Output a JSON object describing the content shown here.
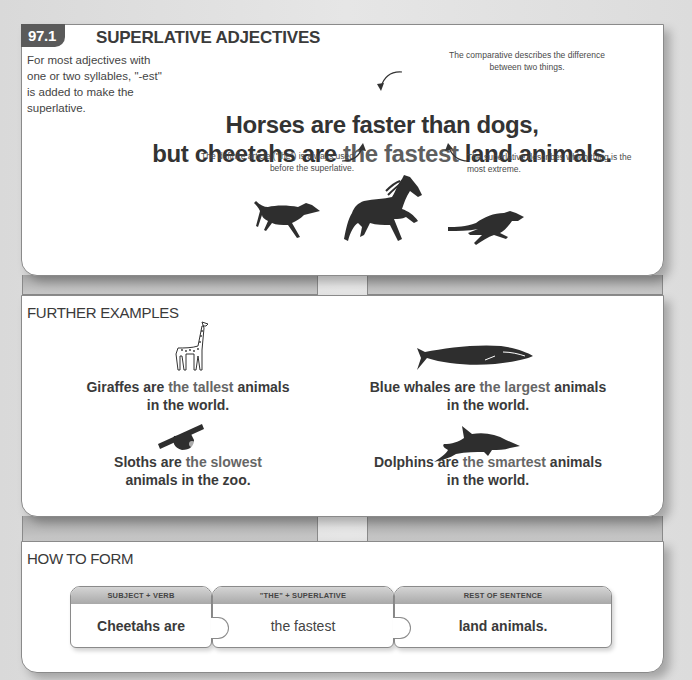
{
  "section": {
    "number": "97.1",
    "title": "SUPERLATIVE ADJECTIVES",
    "intro": "For most adjectives with one or two syllables, \"-est\" is added to make the superlative.",
    "headline": {
      "line1": "Horses are faster than dogs,",
      "line2_prefix": "but cheetahs are ",
      "line2_superlative": "the fastest",
      "line2_suffix": " land animals."
    },
    "notes": {
      "comparative": "The comparative describes the difference between two things.",
      "article": "The definite article (\"the\") is always used before the superlative.",
      "superlative": "The superlative describes which thing is the most extreme."
    },
    "animals": [
      "dog-icon",
      "horse-icon",
      "cheetah-icon"
    ]
  },
  "further_examples": {
    "title": "FURTHER EXAMPLES",
    "items": [
      {
        "icon": "giraffe-icon",
        "subject": "Giraffes are ",
        "superlative": "the tallest",
        "rest": " animals",
        "line2": "in the world."
      },
      {
        "icon": "blue-whale-icon",
        "subject": "Blue whales are ",
        "superlative": "the largest",
        "rest": " animals",
        "line2": "in the world."
      },
      {
        "icon": "sloth-icon",
        "subject": "Sloths are ",
        "superlative": "the slowest",
        "rest": "",
        "line2": "animals in the zoo."
      },
      {
        "icon": "dolphin-icon",
        "subject": "Dolphins are ",
        "superlative": "the smartest",
        "rest": " animals",
        "line2": "in the world."
      }
    ]
  },
  "how_to_form": {
    "title": "HOW TO FORM",
    "pieces": [
      {
        "header": "SUBJECT + VERB",
        "text": "Cheetahs are"
      },
      {
        "header": "\"THE\" + SUPERLATIVE",
        "text": "the fastest"
      },
      {
        "header": "REST OF SENTENCE",
        "text": "land animals."
      }
    ]
  },
  "colors": {
    "tag_bg": "#5a5a5a",
    "text": "#3a3a3a",
    "superlative_text": "#5e5e5e",
    "page_bg": "#e0e0e0",
    "panel_bg": "#ffffff"
  }
}
